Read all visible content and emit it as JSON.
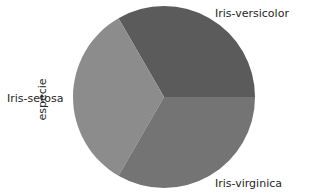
{
  "chart_data": {
    "type": "pie",
    "title": "",
    "ylabel": "especie",
    "categories": [
      "Iris-setosa",
      "Iris-versicolor",
      "Iris-virginica"
    ],
    "values": [
      50,
      50,
      50
    ],
    "colors": [
      "#8c8c8c",
      "#5b5b5b",
      "#747474"
    ],
    "startangle_deg": 0,
    "legend": false
  },
  "labels": {
    "versicolor": "Iris-versicolor",
    "setosa": "Iris-setosa",
    "virginica": "Iris-virginica",
    "ylabel": "especie"
  }
}
